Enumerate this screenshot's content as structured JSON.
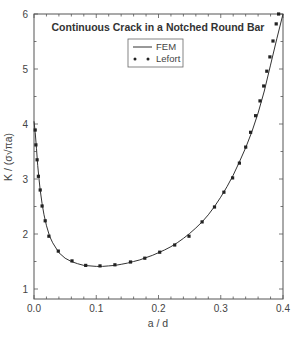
{
  "chart_data": {
    "type": "line",
    "title": "Continuous Crack in a Notched Round Bar",
    "xlabel": "a / d",
    "ylabel": "K / (σ√πa)",
    "xlim": [
      0.0,
      0.4
    ],
    "ylim": [
      0.83,
      6.0
    ],
    "x_ticks": [
      0.0,
      0.1,
      0.2,
      0.3,
      0.4
    ],
    "x_tick_labels": [
      "0.0",
      "0.1",
      "0.2",
      "0.3",
      "0.4"
    ],
    "y_ticks": [
      1,
      2,
      3,
      4,
      5,
      6
    ],
    "y_tick_labels": [
      "1",
      "2",
      "3",
      "4",
      "5",
      "6"
    ],
    "grid": false,
    "legend_position": "upper center",
    "series": [
      {
        "name": "FEM",
        "style": "solid line",
        "x": [
          0.0,
          0.002,
          0.004,
          0.006,
          0.008,
          0.01,
          0.013,
          0.016,
          0.02,
          0.025,
          0.03,
          0.04,
          0.05,
          0.06,
          0.07,
          0.08,
          0.09,
          0.1,
          0.11,
          0.12,
          0.13,
          0.14,
          0.15,
          0.16,
          0.17,
          0.18,
          0.19,
          0.2,
          0.21,
          0.22,
          0.23,
          0.24,
          0.25,
          0.26,
          0.27,
          0.28,
          0.29,
          0.3,
          0.31,
          0.32,
          0.33,
          0.34,
          0.35,
          0.36,
          0.37,
          0.38,
          0.39,
          0.4
        ],
        "y": [
          4.05,
          3.85,
          3.55,
          3.25,
          3.0,
          2.8,
          2.55,
          2.35,
          2.15,
          1.96,
          1.84,
          1.66,
          1.56,
          1.5,
          1.46,
          1.43,
          1.42,
          1.41,
          1.41,
          1.42,
          1.43,
          1.45,
          1.47,
          1.5,
          1.53,
          1.57,
          1.61,
          1.66,
          1.71,
          1.77,
          1.84,
          1.92,
          2.01,
          2.11,
          2.22,
          2.35,
          2.5,
          2.67,
          2.86,
          3.07,
          3.31,
          3.57,
          3.86,
          4.2,
          4.6,
          5.07,
          5.55,
          6.1
        ]
      },
      {
        "name": "Lefort",
        "style": "markers",
        "x": [
          0.002,
          0.003,
          0.005,
          0.007,
          0.01,
          0.013,
          0.018,
          0.024,
          0.039,
          0.061,
          0.083,
          0.106,
          0.13,
          0.155,
          0.178,
          0.202,
          0.226,
          0.249,
          0.27,
          0.29,
          0.305,
          0.319,
          0.33,
          0.34,
          0.348,
          0.356,
          0.363,
          0.369,
          0.374,
          0.379,
          0.384,
          0.389,
          0.393
        ],
        "y": [
          3.89,
          3.62,
          3.35,
          3.05,
          2.8,
          2.51,
          2.24,
          1.96,
          1.69,
          1.51,
          1.43,
          1.42,
          1.44,
          1.49,
          1.56,
          1.67,
          1.8,
          1.96,
          2.22,
          2.49,
          2.76,
          3.02,
          3.29,
          3.58,
          3.85,
          4.15,
          4.42,
          4.69,
          4.96,
          5.22,
          5.51,
          5.82,
          6.0
        ]
      }
    ],
    "legend": [
      {
        "label": "FEM",
        "marker": "line"
      },
      {
        "label": "Lefort",
        "marker": "dots"
      }
    ]
  }
}
